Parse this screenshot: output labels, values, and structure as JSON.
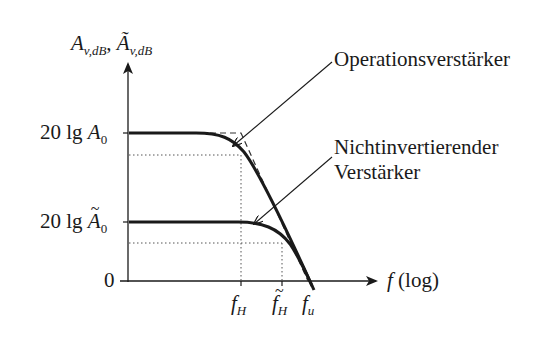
{
  "diagram": {
    "type": "bode-magnitude-plot",
    "y_axis_label": {
      "main": "A",
      "sub": "v,dB",
      "sep": ", ",
      "main2": "Ã",
      "sub2": "v,dB"
    },
    "x_axis_label": {
      "var": "f",
      "suffix": " (log)"
    },
    "y_ticks": [
      {
        "prefix": "20 lg ",
        "var": "A",
        "sub": "0",
        "tilde": false
      },
      {
        "prefix": "20 lg ",
        "var": "A",
        "sub": "0",
        "tilde": true
      },
      {
        "label": "0"
      }
    ],
    "x_ticks": [
      {
        "var": "f",
        "sub": "H",
        "tilde": false
      },
      {
        "var": "f",
        "sub": "H",
        "tilde": true
      },
      {
        "var": "f",
        "sub": "u",
        "tilde": false
      }
    ],
    "curves": [
      {
        "name": "Operationsverstärker",
        "label": "Operationsverstärker"
      },
      {
        "name": "Nichtinvertierender Verstärker",
        "label_line1": "Nichtinvertierender",
        "label_line2": "Verstärker"
      }
    ],
    "colors": {
      "curve": "#1a1a1a",
      "guide": "#555555",
      "background": "#ffffff"
    }
  }
}
